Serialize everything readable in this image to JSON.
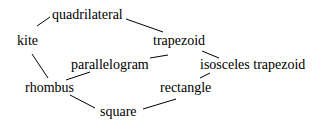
{
  "diagram": {
    "type": "hierarchy",
    "nodes": [
      {
        "id": "quadrilateral",
        "label": "quadrilateral"
      },
      {
        "id": "kite",
        "label": "kite"
      },
      {
        "id": "trapezoid",
        "label": "trapezoid"
      },
      {
        "id": "parallelogram",
        "label": "parallelogram"
      },
      {
        "id": "isosceles_trapezoid",
        "label": "isosceles trapezoid"
      },
      {
        "id": "rhombus",
        "label": "rhombus"
      },
      {
        "id": "rectangle",
        "label": "rectangle"
      },
      {
        "id": "square",
        "label": "square"
      }
    ],
    "edges": [
      [
        "quadrilateral",
        "kite"
      ],
      [
        "quadrilateral",
        "trapezoid"
      ],
      [
        "kite",
        "rhombus"
      ],
      [
        "trapezoid",
        "parallelogram"
      ],
      [
        "trapezoid",
        "isosceles_trapezoid"
      ],
      [
        "parallelogram",
        "rhombus"
      ],
      [
        "isosceles_trapezoid",
        "rectangle"
      ],
      [
        "rhombus",
        "square"
      ],
      [
        "rectangle",
        "square"
      ]
    ],
    "line_color": "#000000",
    "text_color": "#000000"
  }
}
